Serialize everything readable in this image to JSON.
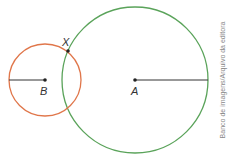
{
  "diagram": {
    "circle_a": {
      "center_label": "A",
      "cx": 135,
      "cy": 80,
      "r": 73,
      "color": "#5aa35a"
    },
    "circle_b": {
      "center_label": "B",
      "cx": 45,
      "cy": 80,
      "r": 36,
      "color": "#e0764a"
    },
    "intersection_label": "X",
    "credit": "Banco de imagens/Arquivo da editora"
  }
}
